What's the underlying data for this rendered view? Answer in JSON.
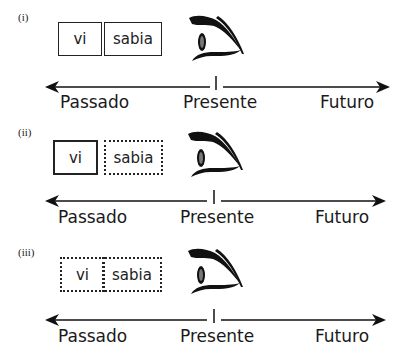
{
  "panels": [
    {
      "label": "(i)",
      "boxes": [
        {
          "text": "vi",
          "style": "solid"
        },
        {
          "text": "sabia",
          "style": "solid"
        }
      ],
      "axis": {
        "left": "Passado",
        "center": "Presente",
        "right": "Futuro"
      }
    },
    {
      "label": "(ii)",
      "boxes": [
        {
          "text": "vi",
          "style": "solid"
        },
        {
          "text": "sabia",
          "style": "dotted"
        }
      ],
      "axis": {
        "left": "Passado",
        "center": "Presente",
        "right": "Futuro"
      }
    },
    {
      "label": "(iii)",
      "boxes": [
        {
          "text": "vi",
          "style": "dotted"
        },
        {
          "text": "sabia",
          "style": "dotted"
        }
      ],
      "axis": {
        "left": "Passado",
        "center": "Presente",
        "right": "Futuro"
      }
    }
  ],
  "icons": {
    "observer": "eye-icon"
  },
  "colors": {
    "ink": "#1a1a1a",
    "background": "#ffffff"
  }
}
